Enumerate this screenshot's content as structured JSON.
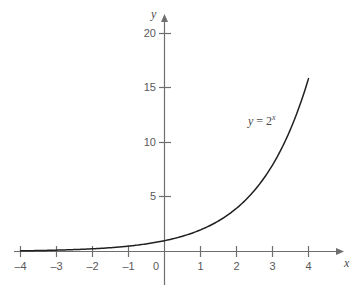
{
  "chart_data": {
    "type": "line",
    "title": "",
    "annotation": "y = 2^x",
    "annotation_parts": {
      "lhs": "y",
      "equals": "=",
      "base": "2",
      "exponent": "x"
    },
    "xlabel": "x",
    "ylabel": "y",
    "xlim": [
      -4.4,
      4.4
    ],
    "ylim": [
      -0.5,
      21.5
    ],
    "xticks": [
      -4,
      -3,
      -2,
      -1,
      0,
      1,
      2,
      3,
      4
    ],
    "xtick_labels": [
      "–4",
      "–3",
      "–2",
      "–1",
      "0",
      "1",
      "2",
      "3",
      "4"
    ],
    "yticks": [
      5,
      10,
      15,
      20
    ],
    "ytick_labels": [
      "5",
      "10",
      "15",
      "20"
    ],
    "grid": false,
    "legend": "none",
    "series": [
      {
        "name": "y = 2^x",
        "x": [
          -4,
          -3.5,
          -3,
          -2.5,
          -2,
          -1.5,
          -1,
          -0.5,
          0,
          0.5,
          1,
          1.5,
          2,
          2.5,
          3,
          3.5,
          4
        ],
        "y": [
          0.0625,
          0.088,
          0.125,
          0.177,
          0.25,
          0.354,
          0.5,
          0.707,
          1,
          1.414,
          2,
          2.828,
          4,
          5.657,
          8,
          11.314,
          16
        ]
      }
    ],
    "colors": {
      "curve": "#231f20",
      "axis": "#6d6e70",
      "tick_text": "#58585a",
      "background": "#ffffff"
    }
  }
}
